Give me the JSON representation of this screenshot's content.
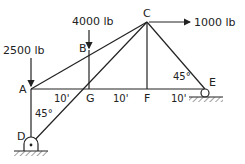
{
  "diagram": {
    "type": "truss",
    "joints": {
      "A": {
        "label": "A"
      },
      "B": {
        "label": "B"
      },
      "C": {
        "label": "C"
      },
      "D": {
        "label": "D"
      },
      "E": {
        "label": "E"
      },
      "F": {
        "label": "F"
      },
      "G": {
        "label": "G"
      }
    },
    "loads": [
      {
        "joint": "A",
        "label": "2500 lb",
        "direction": "down"
      },
      {
        "joint": "B",
        "label": "4000 lb",
        "direction": "down"
      },
      {
        "joint": "C",
        "label": "1000 lb",
        "direction": "right"
      }
    ],
    "dimensions": [
      {
        "label": "10'",
        "span": "A-G"
      },
      {
        "label": "10'",
        "span": "G-F"
      },
      {
        "label": "10'",
        "span": "F-E"
      }
    ],
    "angles": [
      {
        "label": "45°",
        "at": "E"
      },
      {
        "label": "45°",
        "at": "D"
      }
    ],
    "supports": [
      {
        "joint": "D",
        "type": "pin"
      },
      {
        "joint": "E",
        "type": "roller"
      }
    ]
  }
}
